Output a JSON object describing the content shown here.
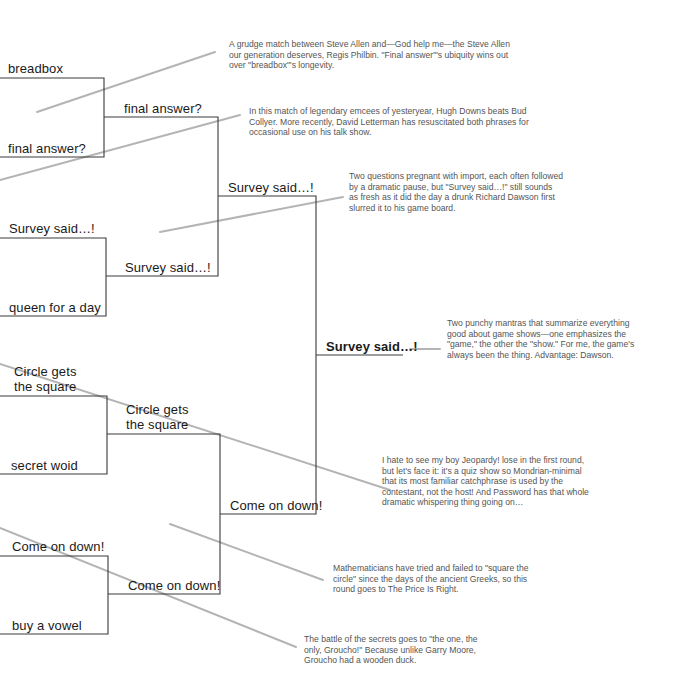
{
  "colors": {
    "bracket_line": "#3a3a3a",
    "connector_line": "#b4b4b4",
    "entry_text": "#1a1a1a",
    "note_text": "#555555",
    "background": "#ffffff"
  },
  "bracket": {
    "round1": [
      {
        "label": "breadbox"
      },
      {
        "label": "final answer?"
      },
      {
        "label": "Survey said…!"
      },
      {
        "label": "queen for a day"
      },
      {
        "label": "Circle gets the square"
      },
      {
        "label": "secret woid"
      },
      {
        "label": "Come on down!"
      },
      {
        "label": "buy a vowel"
      }
    ],
    "round2": [
      {
        "label": "final answer?"
      },
      {
        "label": "Survey said…!"
      },
      {
        "label": "Circle gets the square"
      },
      {
        "label": "Come on down!"
      }
    ],
    "round3": [
      {
        "label": "Survey said…!"
      },
      {
        "label": "Come on down!"
      }
    ],
    "winner": {
      "label": "Survey said…!"
    }
  },
  "notes": [
    {
      "id": "breadbox-vs-final-answer",
      "lines": [
        "A grudge match between Steve Allen and—God help me—the Steve Allen",
        "our generation deserves, Regis Philbin. \"Final answer\"'s ubiquity wins out",
        "over \"breadbox\"'s longevity."
      ]
    },
    {
      "id": "survey-vs-queen",
      "lines": [
        "In this match of legendary emcees of yesteryear, Hugh Downs beats Bud",
        "Collyer. More recently, David Letterman has resuscitated both phrases for",
        "occasional use on his talk show."
      ]
    },
    {
      "id": "final-answer-vs-survey",
      "lines": [
        "Two questions pregnant with import, each often followed",
        "by a dramatic pause, but \"Survey said…!\" still sounds",
        "as fresh as it did the day a drunk Richard Dawson first",
        "slurred it to his game board."
      ]
    },
    {
      "id": "championship",
      "lines": [
        "Two punchy mantras that summarize everything",
        "good about game shows—one emphasizes the",
        "\"game,\" the other the \"show.\" For me, the game's",
        "always been the thing. Advantage: Dawson."
      ]
    },
    {
      "id": "circle-vs-secret",
      "lines": [
        "I hate to see my boy Jeopardy! lose in the first round,",
        "but let's face it: it's a quiz show so Mondrian-minimal",
        "that its most familiar catchphrase is used by the",
        "contestant, not the host! And Password has that whole",
        "dramatic whispering thing going on…"
      ]
    },
    {
      "id": "circle-vs-come-on-down",
      "lines": [
        "Mathematicians have tried and failed to \"square the",
        "circle\" since the days of the ancient Greeks, so this",
        "round goes to The Price Is Right."
      ]
    },
    {
      "id": "come-on-down-vs-vowel",
      "lines": [
        "The battle of the secrets goes to \"the one, the",
        "only, Groucho!\" Because unlike Garry Moore,",
        "Groucho had a wooden duck."
      ]
    }
  ]
}
